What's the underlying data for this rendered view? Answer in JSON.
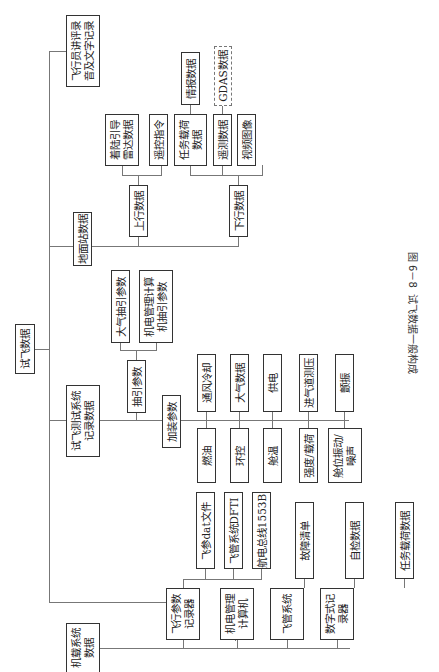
{
  "diagram": {
    "root": "试飞数据",
    "branches": {
      "pilot": "飞行员讲评录\n音及文字记录",
      "ground": {
        "label": "地面站数据",
        "uplink": {
          "label": "上行数据",
          "children": [
            "着陆引导\n雷达数据",
            "遥控指令"
          ]
        },
        "downlink": {
          "label": "下行数据",
          "children": [
            "任务载荷\n数据",
            "遥测数据",
            "视频图像"
          ],
          "task_payload_child": "情报数据",
          "telemetry_child": "GDAS数据"
        }
      },
      "test_system": {
        "label": "试飞测试系统\n记录数据",
        "bleed": {
          "label": "抽引参数",
          "children": [
            "大气抽引参数",
            "机电管理计算\n机抽引参数"
          ]
        },
        "added": {
          "label": "加装参数",
          "top_row": [
            "通风冷却",
            "大气数据",
            "供电",
            "进气道测压",
            "颤振"
          ],
          "bottom_row": [
            "燃油",
            "环控",
            "舱温",
            "强度/载荷",
            "舱位振动/\n噪声"
          ]
        }
      },
      "onboard": {
        "label": "机载系统\n数据",
        "children": [
          {
            "label": "飞行参数\n记录器",
            "children": [
              "飞参dat文件",
              "飞管系统DFTI",
              "航电总线1553B"
            ]
          },
          {
            "label": "机电管理\n计算机",
            "children": [
              "故障清单"
            ]
          },
          {
            "label": "飞管系统",
            "children": [
              "自检数据"
            ]
          },
          {
            "label": "数字式记\n录器",
            "children": [
              "任务载荷数据"
            ]
          }
        ]
      }
    },
    "caption": "图 6－8  试飞数据一般构成"
  }
}
